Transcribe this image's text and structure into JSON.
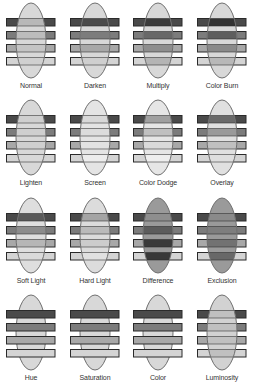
{
  "colors": {
    "bar_stroke": "#2a2a2a",
    "ellipse_stroke": "#6e6e6e",
    "bar_fills": [
      "#4a4a4a",
      "#7c7c7c",
      "#a8a8a8",
      "#d4d4d4"
    ],
    "ellipse_fill": "#d2d2d2",
    "label": "#333333"
  },
  "cells": [
    {
      "label": "Normal",
      "mode": "normal",
      "ellipse_front": true,
      "tones": [
        "#b8b8b8",
        "#bcbcbc",
        "#c4c4c4",
        "#d0d0d0"
      ],
      "ellipse_tone": "#d8d8d8"
    },
    {
      "label": "Darken",
      "mode": "darken",
      "ellipse_front": true,
      "tones": [
        "#4a4a4a",
        "#7c7c7c",
        "#a8a8a8",
        "#cfcfcf"
      ],
      "ellipse_tone": "#d8d8d8"
    },
    {
      "label": "Multiply",
      "mode": "multiply",
      "ellipse_front": true,
      "tones": [
        "#3c3c3c",
        "#686868",
        "#8e8e8e",
        "#b4b4b4"
      ],
      "ellipse_tone": "#d8d8d8"
    },
    {
      "label": "Color Burn",
      "mode": "color-burn",
      "ellipse_front": true,
      "tones": [
        "#333333",
        "#5e5e5e",
        "#8a8a8a",
        "#b8b8b8"
      ],
      "ellipse_tone": "#d8d8d8"
    },
    {
      "label": "Lighten",
      "mode": "lighten",
      "ellipse_front": true,
      "tones": [
        "#cfcfcf",
        "#cfcfcf",
        "#cfcfcf",
        "#d8d8d8"
      ],
      "ellipse_tone": "#d8d8d8"
    },
    {
      "label": "Screen",
      "mode": "screen",
      "ellipse_front": true,
      "tones": [
        "#d8d8d8",
        "#dcdcdc",
        "#e2e2e2",
        "#ececec"
      ],
      "ellipse_tone": "#e4e4e4"
    },
    {
      "label": "Color Dodge",
      "mode": "color-dodge",
      "ellipse_front": true,
      "tones": [
        "#a0a0a0",
        "#c0c0c0",
        "#dadada",
        "#eeeeee"
      ],
      "ellipse_tone": "#e6e6e6"
    },
    {
      "label": "Overlay",
      "mode": "overlay",
      "ellipse_front": true,
      "tones": [
        "#6a6a6a",
        "#9a9a9a",
        "#c0c0c0",
        "#dedede"
      ],
      "ellipse_tone": "#e0e0e0"
    },
    {
      "label": "Soft Light",
      "mode": "soft-light",
      "ellipse_front": true,
      "tones": [
        "#5a5a5a",
        "#8c8c8c",
        "#b6b6b6",
        "#dadada"
      ],
      "ellipse_tone": "#dedede"
    },
    {
      "label": "Hard Light",
      "mode": "hard-light",
      "ellipse_front": true,
      "tones": [
        "#a4a4a4",
        "#bababa",
        "#cccccc",
        "#e0e0e0"
      ],
      "ellipse_tone": "#dcdcdc"
    },
    {
      "label": "Difference",
      "mode": "difference",
      "ellipse_front": true,
      "tones": [
        "#8e8e8e",
        "#5c5c5c",
        "#3a3a3a",
        "#383838"
      ],
      "ellipse_tone": "#9a9a9a"
    },
    {
      "label": "Exclusion",
      "mode": "exclusion",
      "ellipse_front": true,
      "tones": [
        "#8a8a8a",
        "#7e7e7e",
        "#727272",
        "#686868"
      ],
      "ellipse_tone": "#9a9a9a"
    },
    {
      "label": "Hue",
      "mode": "hue",
      "ellipse_front": false,
      "tones": [
        "#4a4a4a",
        "#7c7c7c",
        "#a8a8a8",
        "#d4d4d4"
      ],
      "ellipse_tone": "#d8d8d8"
    },
    {
      "label": "Saturation",
      "mode": "saturation",
      "ellipse_front": false,
      "tones": [
        "#4a4a4a",
        "#7c7c7c",
        "#a8a8a8",
        "#d4d4d4"
      ],
      "ellipse_tone": "#d8d8d8"
    },
    {
      "label": "Color",
      "mode": "color",
      "ellipse_front": false,
      "tones": [
        "#4a4a4a",
        "#7c7c7c",
        "#a8a8a8",
        "#d4d4d4"
      ],
      "ellipse_tone": "#d8d8d8"
    },
    {
      "label": "Luminosity",
      "mode": "luminosity",
      "ellipse_front": true,
      "tones": [
        "#c0c0c0",
        "#c0c0c0",
        "#c0c0c0",
        "#c0c0c0"
      ],
      "ellipse_tone": "#d2d2d2"
    }
  ]
}
